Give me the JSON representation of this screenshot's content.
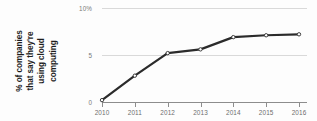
{
  "chart_data": {
    "type": "line",
    "title": "",
    "subtitle": "",
    "xlabel": "",
    "ylabel": "% of companies that say they're using cloud computing",
    "ylabel_lines": [
      "% of companies",
      "that say they're",
      "using cloud",
      "computing"
    ],
    "categories": [
      "2010",
      "2011",
      "2012",
      "2013",
      "2014",
      "2015",
      "2016"
    ],
    "x": [
      2010,
      2011,
      2012,
      2013,
      2014,
      2015,
      2016
    ],
    "values": [
      0.2,
      2.8,
      5.2,
      5.6,
      6.9,
      7.1,
      7.2
    ],
    "series": [
      {
        "name": "% of companies using cloud computing",
        "values": [
          0.2,
          2.8,
          5.2,
          5.6,
          6.9,
          7.1,
          7.2
        ]
      }
    ],
    "ylim": [
      0,
      10
    ],
    "xlim": [
      2010,
      2016
    ],
    "ytick_values": [
      0,
      5,
      10
    ],
    "ytick_labels": [
      "0",
      "5",
      "10%"
    ],
    "grid": true,
    "legend": false,
    "legend_position": "none",
    "marker": "circle",
    "line_color": "#2b2b2b",
    "marker_fill": "#ffffff",
    "marker_edge": "#2b2b2b",
    "grid_color": "#d9d9d9",
    "axis_color": "#8d8d8d",
    "tick_label_color": "#6d6d6d",
    "background": "#ffffff"
  }
}
